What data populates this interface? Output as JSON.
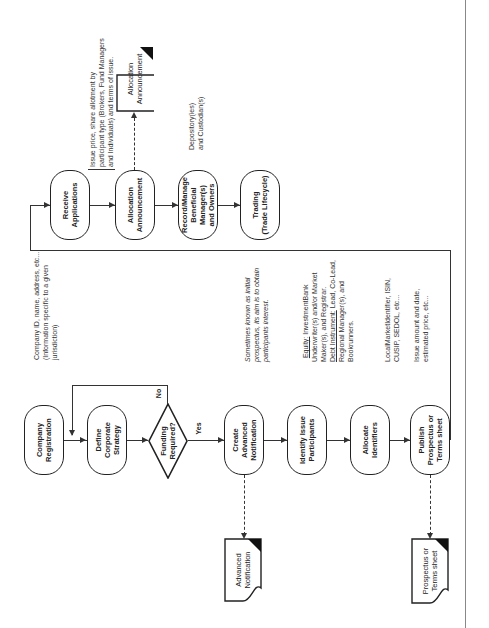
{
  "diagram": {
    "orientation": "rotated-90-ccw",
    "nodes": {
      "company_registration": "Company\nRegistration",
      "define_strategy": "Define\nCorporate\nStrategy",
      "funding_required": "Funding\nRequired?",
      "create_advanced_notification": "Create\nAdvanced\nNotification",
      "identify_participants": "Identify Issue\nParticipants",
      "allocate_identifiers": "Allocate\nIdentifiers",
      "publish_prospectus": "Publish\nProspectus or\nTerms sheet",
      "receive_applications": "Receive\nApplications",
      "allocation_announcement": "Allocation\nAnnouncement",
      "record_manage": "Record/Manage\nBeneficial\nManager(s)\nand Owners",
      "trading": "Trading\n(Trade Lifecycle)"
    },
    "documents": {
      "advanced_notification": "Advanced\nNotification",
      "prospectus_terms": "Prospectus or\nTerms sheet",
      "allocation_announcement": "Allocation\nAnnouncement"
    },
    "decision_labels": {
      "yes": "Yes",
      "no": "No"
    },
    "notes": {
      "company_registration": "Company ID, name, address, etc...\n(Information specific to a given\njurisdiction)",
      "create_advanced_notification": "Sometimes known as initial\nprospectus, its aim is to obtain\nparticipants interest.",
      "identify_participants_equity_label": "Equity:",
      "identify_participants_equity": " InvestmentBank\nUnderwriter(s) and/or Market\nMaker(s), and Registrar.",
      "identify_participants_debt_label": "Debt Instrument:",
      "identify_participants_debt": " Lead, Co-Lead,\nRegional Manager(s), and\nBookrunners.",
      "allocate_identifiers": "LocalMarketIdentifier, ISIN,\nCUSIP, SEDOL, etc...",
      "publish_prospectus": "Issue amount and date,\nestimated price, etc...",
      "allocation_announcement": "Issue price, share allotment by\nparticipant type (Brokers, Fund Managers\nand Individuals) and terms of issue.",
      "record_manage": "Depository(ies)\nand Custodian(s)"
    }
  }
}
